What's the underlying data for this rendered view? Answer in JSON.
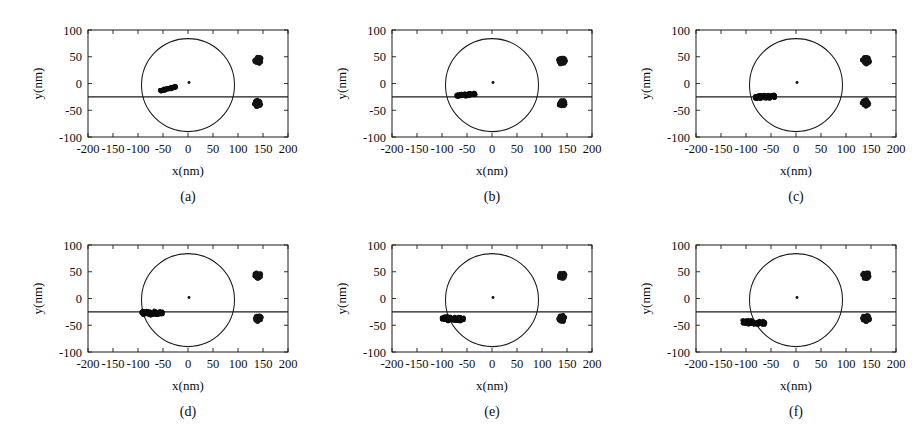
{
  "figure": {
    "panel_count": 6,
    "axis_labels": {
      "x": "x(nm)",
      "y": "y(nm)"
    },
    "captions": [
      "(a)",
      "(b)",
      "(c)",
      "(d)",
      "(e)",
      "(f)"
    ]
  },
  "chart_data": {
    "type": "scatter",
    "title": "",
    "xlabel": "x(nm)",
    "ylabel": "y(nm)",
    "xlim": [
      -200,
      200
    ],
    "ylim": [
      -100,
      100
    ],
    "xticks": [
      -200,
      -150,
      -100,
      -50,
      0,
      50,
      100,
      150,
      200
    ],
    "yticks": [
      -100,
      -50,
      0,
      50,
      100
    ],
    "xticklabels": [
      "-200",
      "-150",
      "-100",
      "-50",
      "0",
      "50",
      "100",
      "150",
      "200"
    ],
    "yticklabels": [
      "-100",
      "-50",
      "0",
      "50",
      "100"
    ],
    "grid": false,
    "legend": null,
    "shared_annotations": {
      "circle": {
        "label": "reference-circle",
        "center_x": 0,
        "center_y": -3,
        "radius_nm": 93
      },
      "horizontal_line": {
        "label": "reference-line",
        "y": -25,
        "x_from": -200,
        "x_to": 200
      },
      "center_marker": {
        "label": "center-point",
        "x": 2,
        "y": 2
      },
      "fixed_blobs": [
        {
          "label": "upper-blob",
          "x": 140,
          "y": 43,
          "radius_nm": 13
        },
        {
          "label": "lower-blob",
          "x": 140,
          "y": -37,
          "radius_nm": 13
        }
      ]
    },
    "panels": [
      {
        "caption": "(a)",
        "cluster": {
          "label": "particle-cluster",
          "x_center": -40,
          "y_center": -10,
          "x_extent": [
            -56,
            -24
          ],
          "y_extent": [
            -15,
            -5
          ],
          "tilt_deg": -14,
          "length_nm": 34,
          "thickness_nm": 5
        }
      },
      {
        "caption": "(b)",
        "cluster": {
          "label": "particle-cluster",
          "x_center": -52,
          "y_center": -21,
          "x_extent": [
            -72,
            -32
          ],
          "y_extent": [
            -26,
            -16
          ],
          "tilt_deg": -6,
          "length_nm": 40,
          "thickness_nm": 7
        }
      },
      {
        "caption": "(c)",
        "cluster": {
          "label": "particle-cluster",
          "x_center": -62,
          "y_center": -25,
          "x_extent": [
            -84,
            -42
          ],
          "y_extent": [
            -31,
            -19
          ],
          "tilt_deg": -2,
          "length_nm": 42,
          "thickness_nm": 9
        }
      },
      {
        "caption": "(d)",
        "cluster": {
          "label": "particle-cluster",
          "x_center": -72,
          "y_center": -27,
          "x_extent": [
            -94,
            -50
          ],
          "y_extent": [
            -34,
            -21
          ],
          "tilt_deg": 0,
          "length_nm": 44,
          "thickness_nm": 10
        }
      },
      {
        "caption": "(e)",
        "cluster": {
          "label": "particle-cluster",
          "x_center": -78,
          "y_center": -38,
          "x_extent": [
            -102,
            -56
          ],
          "y_extent": [
            -45,
            -31
          ],
          "tilt_deg": 2,
          "length_nm": 46,
          "thickness_nm": 11
        }
      },
      {
        "caption": "(f)",
        "cluster": {
          "label": "particle-cluster",
          "x_center": -84,
          "y_center": -45,
          "x_extent": [
            -110,
            -62
          ],
          "y_extent": [
            -51,
            -39
          ],
          "tilt_deg": 3,
          "length_nm": 48,
          "thickness_nm": 10
        }
      }
    ]
  },
  "colors": {
    "background": "#ffffff",
    "ink": "#1a1a1a",
    "blob": "#141414",
    "blob_halo": "#59595e"
  }
}
